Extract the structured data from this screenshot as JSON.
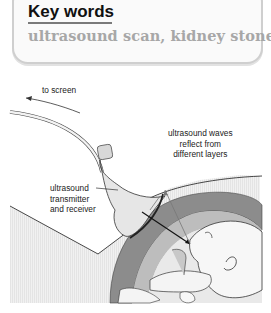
{
  "key_words": {
    "title": "Key words",
    "terms": "ultrasound scan, kidney stone"
  },
  "diagram": {
    "labels": {
      "to_screen": "to screen",
      "waves_line1": "ultrasound waves",
      "waves_line2": "reflect from",
      "waves_line3": "different layers",
      "device_line1": "ultrasound",
      "device_line2": "transmitter",
      "device_line3": "and receiver"
    },
    "colors": {
      "box_border": "#cfcfcf",
      "terms_text": "#a7a7a7",
      "uterus_wall": "#8c8c8c",
      "probe": "#e6e6e6"
    }
  }
}
